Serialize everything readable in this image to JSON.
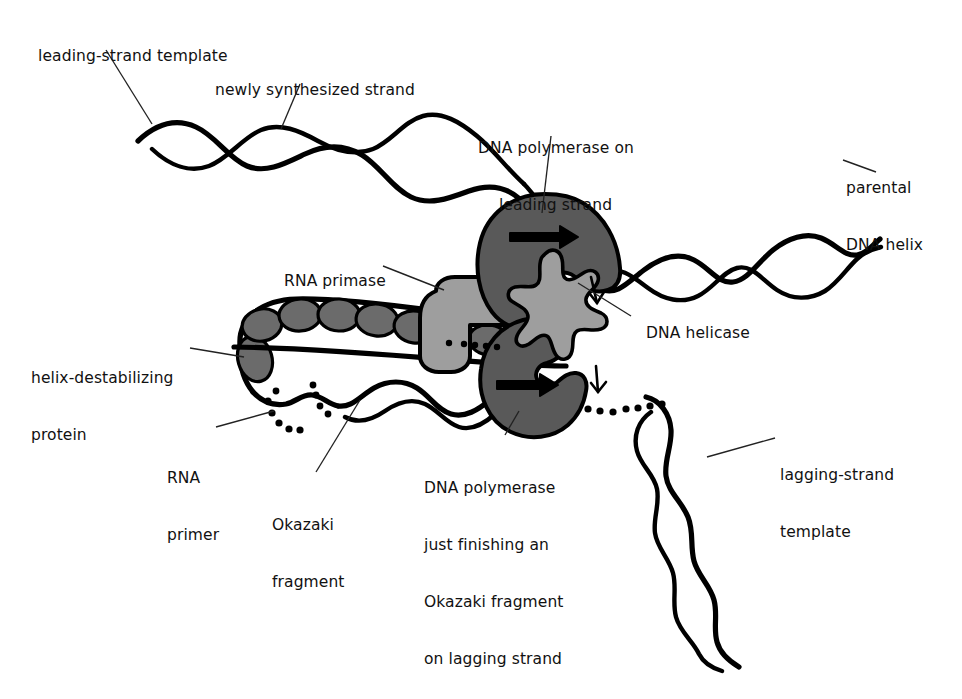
{
  "figure": {
    "type": "biological-schematic",
    "background_color": "#ffffff",
    "ink_color": "#000000"
  },
  "palette": {
    "stroke": "#000000",
    "polymerase_fill": "#595959",
    "primase_fill": "#9e9e9e",
    "helicase_fill": "#9e9e9e",
    "ssb_protein_fill": "#6b6b6b",
    "leader_line": "#222222",
    "background": "#ffffff"
  },
  "labels": [
    {
      "id": "leading-strand-template",
      "text": "leading-strand template",
      "x": 28,
      "y": 28,
      "align": "left"
    },
    {
      "id": "newly-synthesized-strand",
      "text": "newly synthesized strand",
      "x": 205,
      "y": 62,
      "align": "left"
    },
    {
      "id": "dna-polymerase-leading",
      "text": "DNA polymerase on\nleading strand",
      "line1": "DNA polymerase on",
      "line2": "leading strand",
      "x": 478,
      "y": 101,
      "align": "center"
    },
    {
      "id": "parental-dna-helix",
      "text": "parental\nDNA helix",
      "line1": "parental",
      "line2": "DNA helix",
      "x": 846,
      "y": 141,
      "align": "left"
    },
    {
      "id": "rna-primase",
      "text": "RNA primase",
      "x": 274,
      "y": 253,
      "align": "left"
    },
    {
      "id": "dna-helicase",
      "text": "DNA helicase",
      "x": 636,
      "y": 313,
      "align": "left"
    },
    {
      "id": "helix-destabilizing-protein",
      "text": "helix-destabilizing\nprotein",
      "line1": "helix-destabilizing",
      "line2": "protein",
      "x": 31,
      "y": 331,
      "align": "left"
    },
    {
      "id": "rna-primer",
      "text": "RNA\nprimer",
      "line1": "RNA",
      "line2": "primer",
      "x": 167,
      "y": 431,
      "align": "left"
    },
    {
      "id": "okazaki-fragment",
      "text": "Okazaki\nfragment",
      "line1": "Okazaki",
      "line2": "fragment",
      "x": 272,
      "y": 478,
      "align": "left"
    },
    {
      "id": "dna-polymerase-lagging",
      "text": "DNA polymerase\njust finishing an\nOkazaki fragment\non lagging strand",
      "line1": "DNA polymerase",
      "line2": "just finishing an",
      "line3": "Okazaki fragment",
      "line4": "on lagging strand",
      "x": 424,
      "y": 441,
      "align": "left"
    },
    {
      "id": "lagging-strand-template",
      "text": "lagging-strand\ntemplate",
      "line1": "lagging-strand",
      "line2": "template",
      "x": 780,
      "y": 428,
      "align": "left"
    }
  ],
  "structures": {
    "polymerase_leading": {
      "name": "DNA polymerase on leading strand",
      "arrow_direction": "right"
    },
    "polymerase_lagging": {
      "name": "DNA polymerase on lagging strand",
      "arrow_direction": "right"
    },
    "rna_primase": {
      "name": "RNA primase"
    },
    "dna_helicase": {
      "name": "DNA helicase"
    },
    "ssb_proteins": {
      "name": "helix-destabilizing protein",
      "count": 8
    },
    "strands": [
      {
        "name": "leading-strand template",
        "style": "double-helix"
      },
      {
        "name": "newly synthesized strand",
        "style": "double-helix"
      },
      {
        "name": "parental DNA helix",
        "style": "double-helix"
      },
      {
        "name": "lagging-strand template",
        "style": "double-helix"
      },
      {
        "name": "okazaki fragment",
        "style": "double-helix"
      },
      {
        "name": "RNA primer",
        "style": "dotted"
      }
    ]
  }
}
